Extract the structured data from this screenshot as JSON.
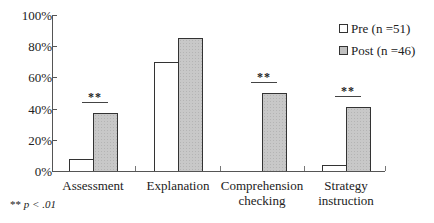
{
  "chart_data": {
    "type": "bar",
    "title": "",
    "xlabel": "",
    "ylabel": "",
    "ylim": [
      0,
      100
    ],
    "y_ticks": [
      "0%",
      "20%",
      "40%",
      "60%",
      "80%",
      "100%"
    ],
    "categories": [
      "Assessment",
      "Explanation",
      "Comprehension checking",
      "Strategy instruction"
    ],
    "category_label_lines": [
      [
        "Assessment"
      ],
      [
        "Explanation"
      ],
      [
        "Comprehension",
        "checking"
      ],
      [
        "Strategy",
        "instruction"
      ]
    ],
    "series": [
      {
        "name": "Pre (n =51)",
        "values": [
          8,
          70,
          0,
          4
        ],
        "color": "#ffffff"
      },
      {
        "name": "Post (n =46)",
        "values": [
          37,
          85,
          50,
          41
        ],
        "color": "#c8c8c8"
      }
    ],
    "significance": [
      {
        "category": "Assessment",
        "label": "**"
      },
      {
        "category": "Comprehension checking",
        "label": "**"
      },
      {
        "category": "Strategy instruction",
        "label": "**"
      }
    ],
    "legend_position": "upper right",
    "grid": false,
    "footnote": "** p < .01"
  },
  "legend": {
    "pre": "Pre (n =51)",
    "post": "Post (n =46)"
  },
  "footnote": {
    "stars": "**",
    "text": "p < .01"
  }
}
